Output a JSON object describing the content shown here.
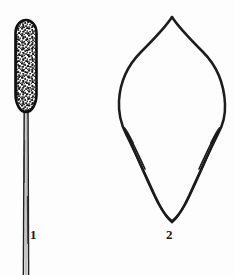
{
  "plate": {
    "kind": "botanical-line-illustration",
    "background_color": "#fdfdfd",
    "ink_color": "#1a1a1a",
    "width": 235,
    "height": 275,
    "figures": [
      {
        "number": "1",
        "name": "stalked-spike",
        "description": "Elongated club-shaped spike (catkin/spadix) with dark outline and dense stippled interior, borne on a long slender double-lined stalk running to the bottom edge.",
        "label_text": "1",
        "outline_color": "#141414",
        "fill_texture": "stipple",
        "spike": {
          "cx": 26,
          "top_y": 20,
          "bottom_y": 112,
          "width": 21
        },
        "stalk": {
          "x": 26,
          "top_y": 112,
          "bottom_y": 275,
          "width": 4
        }
      },
      {
        "number": "2",
        "name": "leaf-bract",
        "description": "Broadly ovate leaf or bract with acuminate apex, widest above the middle, with two narrow inrolled basal wing lobes converging to a sharply pointed base.",
        "label_text": "2",
        "outline_color": "#1a1a1a",
        "fill_texture": "none",
        "apex": {
          "x": 172,
          "y": 17
        },
        "base": {
          "x": 172,
          "y": 222
        },
        "widest_left": {
          "x": 119,
          "y": 101
        },
        "widest_right": {
          "x": 225,
          "y": 104
        }
      }
    ],
    "labels": [
      {
        "name": "figure-label-1",
        "text": "1",
        "x": 30,
        "y": 228
      },
      {
        "name": "figure-label-2",
        "text": "2",
        "x": 166,
        "y": 228
      }
    ]
  }
}
